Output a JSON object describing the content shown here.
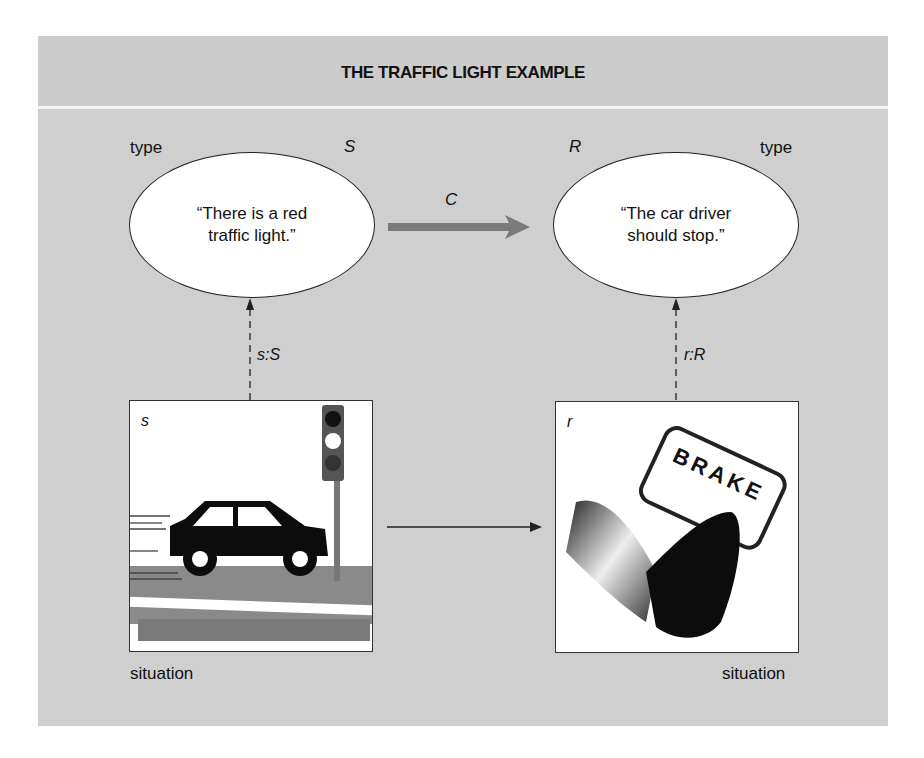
{
  "title": "THE TRAFFIC LIGHT EXAMPLE",
  "types": {
    "left": {
      "type_label": "type",
      "symbol": "S",
      "statement_line1": "“There is a red",
      "statement_line2": "traffic light.”"
    },
    "right": {
      "type_label": "type",
      "symbol": "R",
      "statement_line1": "“The car driver",
      "statement_line2": "should stop.”"
    }
  },
  "constraint_label": "C",
  "relations": {
    "left": "s:S",
    "right": "r:R"
  },
  "situations": {
    "left": {
      "symbol": "s",
      "caption": "situation",
      "image": "car-at-traffic-light"
    },
    "right": {
      "symbol": "r",
      "caption": "situation",
      "image": "foot-on-brake-pedal",
      "pedal_text": "BRAKE"
    }
  },
  "colors": {
    "panel": "#cfcfcf",
    "ellipse": "#ffffff",
    "constraint_arrow": "#7a7a7a",
    "stroke": "#222222"
  }
}
